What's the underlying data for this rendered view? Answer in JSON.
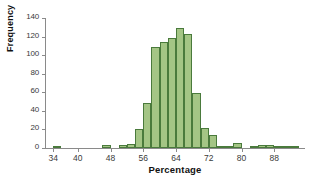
{
  "chart_data": {
    "type": "bar",
    "title": "",
    "subtitle": "",
    "xlabel": "Percentage",
    "ylabel": "Frequency",
    "xlim": [
      32,
      95
    ],
    "ylim": [
      0,
      140
    ],
    "grid": false,
    "legend": null,
    "bin_width": 2,
    "x_ticks": [
      34,
      40,
      48,
      56,
      64,
      72,
      80,
      88
    ],
    "y_ticks": [
      0,
      20,
      40,
      60,
      80,
      100,
      120,
      140
    ],
    "bar_fill_color": "#a4c585",
    "bar_edge_color": "#4a7a3c",
    "axis_color": "#8a8a8a",
    "categories": [
      "34",
      "36",
      "38",
      "40",
      "42",
      "44",
      "46",
      "48",
      "50",
      "52",
      "54",
      "56",
      "58",
      "60",
      "62",
      "64",
      "66",
      "68",
      "70",
      "72",
      "74",
      "76",
      "78",
      "80",
      "82",
      "84",
      "86",
      "88",
      "90",
      "92"
    ],
    "bins": [
      {
        "start": 34,
        "end": 36,
        "value": 2
      },
      {
        "start": 36,
        "end": 38,
        "value": 0
      },
      {
        "start": 38,
        "end": 40,
        "value": 0
      },
      {
        "start": 40,
        "end": 42,
        "value": 0
      },
      {
        "start": 42,
        "end": 44,
        "value": 0
      },
      {
        "start": 44,
        "end": 46,
        "value": 0
      },
      {
        "start": 46,
        "end": 48,
        "value": 3
      },
      {
        "start": 48,
        "end": 50,
        "value": 0
      },
      {
        "start": 50,
        "end": 52,
        "value": 3
      },
      {
        "start": 52,
        "end": 54,
        "value": 4
      },
      {
        "start": 54,
        "end": 56,
        "value": 20
      },
      {
        "start": 56,
        "end": 58,
        "value": 48
      },
      {
        "start": 58,
        "end": 60,
        "value": 109
      },
      {
        "start": 60,
        "end": 62,
        "value": 114
      },
      {
        "start": 62,
        "end": 64,
        "value": 118
      },
      {
        "start": 64,
        "end": 66,
        "value": 129
      },
      {
        "start": 66,
        "end": 68,
        "value": 123
      },
      {
        "start": 68,
        "end": 70,
        "value": 59
      },
      {
        "start": 70,
        "end": 72,
        "value": 22
      },
      {
        "start": 72,
        "end": 74,
        "value": 14
      },
      {
        "start": 74,
        "end": 76,
        "value": 1
      },
      {
        "start": 76,
        "end": 78,
        "value": 1
      },
      {
        "start": 78,
        "end": 80,
        "value": 5
      },
      {
        "start": 80,
        "end": 82,
        "value": 0
      },
      {
        "start": 82,
        "end": 84,
        "value": 2
      },
      {
        "start": 84,
        "end": 86,
        "value": 3
      },
      {
        "start": 86,
        "end": 88,
        "value": 3
      },
      {
        "start": 88,
        "end": 90,
        "value": 1
      },
      {
        "start": 90,
        "end": 92,
        "value": 1
      },
      {
        "start": 92,
        "end": 94,
        "value": 1
      }
    ],
    "values": [
      2,
      0,
      0,
      0,
      0,
      0,
      3,
      0,
      3,
      4,
      20,
      48,
      109,
      114,
      118,
      129,
      123,
      59,
      22,
      14,
      1,
      1,
      5,
      0,
      2,
      3,
      3,
      1,
      1,
      1
    ]
  }
}
